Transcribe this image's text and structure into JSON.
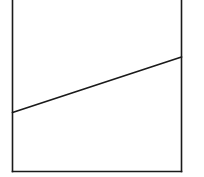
{
  "diagram": {
    "title": "",
    "stroke_color": "#1a1a1a",
    "background_color": "#ffffff",
    "elements": [
      {
        "name": "container-left-wall",
        "kind": "wall"
      },
      {
        "name": "container-right-wall",
        "kind": "wall"
      },
      {
        "name": "container-bottom",
        "kind": "floor"
      },
      {
        "name": "sloped-line",
        "kind": "line",
        "direction": "rising left-to-right"
      }
    ]
  }
}
